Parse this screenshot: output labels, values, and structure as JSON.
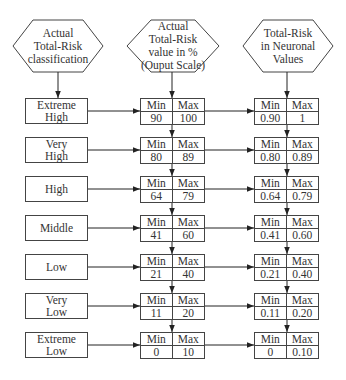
{
  "headers": {
    "classification": [
      "Actual",
      "Total-Risk",
      "classification"
    ],
    "output_scale": [
      "Actual",
      "Total-Risk",
      "value in %",
      "(Ouput Scale)"
    ],
    "neuronal": [
      "Total-Risk",
      "in Neuronal",
      "Values"
    ]
  },
  "labels": {
    "min": "Min",
    "max": "Max"
  },
  "rows": [
    {
      "class": [
        "Extreme",
        "High"
      ],
      "pct_min": "90",
      "pct_max": "100",
      "nv_min": "0.90",
      "nv_max": "1"
    },
    {
      "class": [
        "Very",
        "High"
      ],
      "pct_min": "80",
      "pct_max": "89",
      "nv_min": "0.80",
      "nv_max": "0.89"
    },
    {
      "class": [
        "High"
      ],
      "pct_min": "64",
      "pct_max": "79",
      "nv_min": "0.64",
      "nv_max": "0.79"
    },
    {
      "class": [
        "Middle"
      ],
      "pct_min": "41",
      "pct_max": "60",
      "nv_min": "0.41",
      "nv_max": "0.60"
    },
    {
      "class": [
        "Low"
      ],
      "pct_min": "21",
      "pct_max": "40",
      "nv_min": "0.21",
      "nv_max": "0.40"
    },
    {
      "class": [
        "Very",
        "Low"
      ],
      "pct_min": "11",
      "pct_max": "20",
      "nv_min": "0.11",
      "nv_max": "0.20"
    },
    {
      "class": [
        "Extreme",
        "Low"
      ],
      "pct_min": "0",
      "pct_max": "10",
      "nv_min": "0",
      "nv_max": "0.10"
    }
  ],
  "colors": {
    "stroke": "#444444",
    "text": "#333333",
    "background": "#ffffff"
  }
}
